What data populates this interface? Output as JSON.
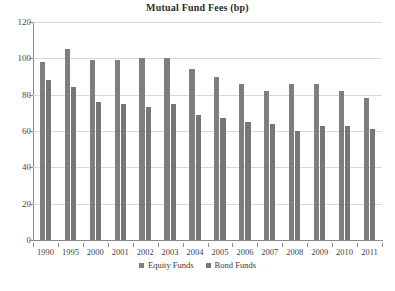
{
  "chart_data": {
    "type": "bar",
    "title": "Mutual Fund Fees (bp)",
    "xlabel": "",
    "ylabel": "",
    "ylim": [
      0,
      120
    ],
    "yticks": [
      0,
      20,
      40,
      60,
      80,
      100,
      120
    ],
    "grid": true,
    "legend_position": "bottom-center",
    "categories": [
      "1990",
      "1995",
      "2000",
      "2001",
      "2002",
      "2003",
      "2004",
      "2005",
      "2006",
      "2007",
      "2008",
      "2009",
      "2010",
      "2011"
    ],
    "series": [
      {
        "name": "Equity Funds",
        "color": "#7e7e7e",
        "values": [
          98,
          105,
          99,
          99,
          100,
          100,
          94,
          90,
          86,
          82,
          86,
          86,
          82,
          78
        ]
      },
      {
        "name": "Bond Funds",
        "color": "#767676",
        "values": [
          88,
          84,
          76,
          75,
          73,
          75,
          69,
          67,
          65,
          64,
          60,
          63,
          63,
          61
        ]
      }
    ]
  },
  "title": {
    "text": "Mutual Fund Fees (bp)"
  },
  "legend": {
    "entries": [
      {
        "label": "Equity Funds"
      },
      {
        "label": "Bond Funds"
      }
    ]
  },
  "caption": {
    "text": ""
  }
}
